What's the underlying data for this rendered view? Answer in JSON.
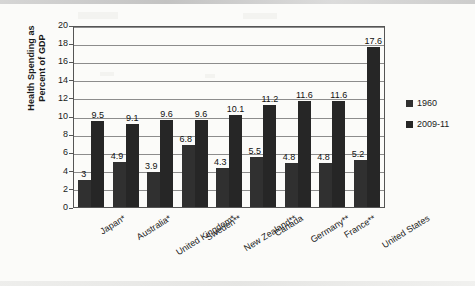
{
  "chart_data": {
    "type": "bar",
    "title": "",
    "xlabel": "",
    "ylabel": "Health Spending as Percent of GDP",
    "ylabel_line1": "Health Spending as",
    "ylabel_line2": "Percent of GDP",
    "ylim": [
      0,
      20
    ],
    "ytick_interval": 2,
    "yticks": [
      "0",
      "2",
      "4",
      "6",
      "8",
      "10",
      "12",
      "14",
      "16",
      "18",
      "20"
    ],
    "grid": true,
    "legend_position": "right",
    "categories": [
      "Japan*",
      "Australia*",
      "United Kingdom*",
      "Sweden**",
      "New Zealand**",
      "Canada",
      "Germany**",
      "France**",
      "United States"
    ],
    "series": [
      {
        "name": "1960",
        "color": "#303030",
        "values": [
          3,
          4.9,
          3.9,
          6.8,
          4.3,
          5.5,
          4.8,
          4.8,
          5.2
        ],
        "labels": [
          "3",
          "4.9",
          "3.9",
          "6.8",
          "4.3",
          "5.5",
          "4.8",
          "4.8",
          "5.2"
        ]
      },
      {
        "name": "2009-11",
        "color": "#262626",
        "values": [
          9.5,
          9.1,
          9.6,
          9.6,
          10.1,
          11.2,
          11.6,
          11.6,
          17.6
        ],
        "labels": [
          "9.5",
          "9.1",
          "9.6",
          "9.6",
          "10.1",
          "11.2",
          "11.6",
          "11.6",
          "17.6"
        ]
      }
    ]
  },
  "legend": {
    "items": [
      {
        "label": "1960",
        "color": "#303030"
      },
      {
        "label": "2009-11",
        "color": "#262626"
      }
    ]
  },
  "colors": {
    "bar_1960": "#303030",
    "bar_2009": "#262626",
    "gridline": "#8c8c8c",
    "axis": "#555555",
    "background": "#fbfbf9"
  }
}
